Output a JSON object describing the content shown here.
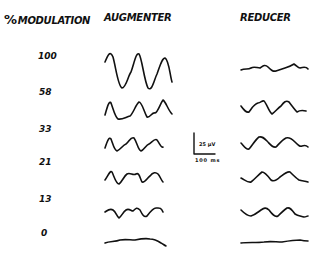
{
  "headers": {
    "modulation": "% MODULATION",
    "modulation_symbol": "%",
    "modulation_word": "MODULATION",
    "augmenter": "AUGMENTER",
    "reducer": "REDUCER"
  },
  "rows": [
    {
      "label": "100",
      "y": 56
    },
    {
      "label": "58",
      "y": 92
    },
    {
      "label": "33",
      "y": 129
    },
    {
      "label": "21",
      "y": 162
    },
    {
      "label": "13",
      "y": 199
    },
    {
      "label": "0",
      "y": 233
    }
  ],
  "scale_bar": {
    "voltage": "25 µV",
    "time": "100 ms"
  }
}
